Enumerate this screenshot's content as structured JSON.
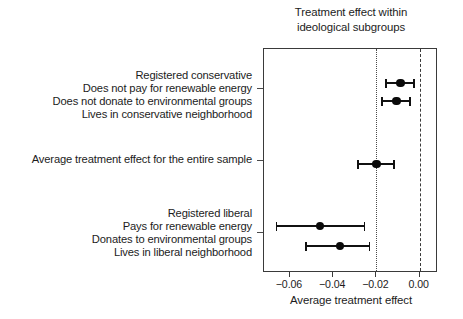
{
  "chart_data": {
    "type": "scatter",
    "title": "Treatment effect within ideological subgroups",
    "title_lines": [
      "Treatment effect within",
      "ideological subgroups"
    ],
    "xlabel": "Average treatment effect",
    "ylabel": "",
    "orientation": "horizontal",
    "grid": false,
    "legend": null,
    "xlim": [
      -0.072,
      0.0085
    ],
    "xticks": [
      -0.06,
      -0.04,
      -0.02,
      0.0
    ],
    "xticklabels": [
      "−0.06",
      "−0.04",
      "−0.02",
      "0.00"
    ],
    "reference_lines": [
      {
        "name": "average-effect-line",
        "value": -0.02,
        "style": "dotted"
      },
      {
        "name": "zero-line",
        "value": 0.0,
        "style": "dashed"
      }
    ],
    "categories": [
      "Registered conservative",
      "Does not pay for renewable energy",
      "Does not donate to environmental groups",
      "Lives in conservative neighborhood",
      "Average treatment effect for the entire sample",
      "Registered liberal",
      "Pays for renewable energy",
      "Donates to environmental groups",
      "Lives in liberal neighborhood"
    ],
    "points": [
      {
        "label": "Does not pay for renewable energy",
        "estimate": -0.0088,
        "ci_low": -0.0158,
        "ci_high": -0.0023
      },
      {
        "label": "Does not donate to environmental groups",
        "estimate": -0.0107,
        "ci_low": -0.0177,
        "ci_high": -0.0042
      },
      {
        "label": "Average treatment effect for the entire sample",
        "estimate": -0.02,
        "ci_low": -0.0288,
        "ci_high": -0.0116
      },
      {
        "label": "Pays for renewable energy",
        "estimate": -0.0461,
        "ci_low": -0.0665,
        "ci_high": -0.0251
      },
      {
        "label": "Donates to environmental groups",
        "estimate": -0.0368,
        "ci_low": -0.053,
        "ci_high": -0.0228
      }
    ]
  },
  "labels": {
    "group_conservative": [
      "Registered conservative",
      "Does not pay for renewable energy",
      "Does not donate to environmental groups",
      "Lives in conservative neighborhood"
    ],
    "group_average": [
      "Average treatment effect for the entire sample"
    ],
    "group_liberal": [
      "Registered liberal",
      "Pays for renewable energy",
      "Donates to environmental groups",
      "Lives in liberal neighborhood"
    ]
  },
  "colors": {
    "point": "#0a0a0a",
    "frame": "#3a3a3a",
    "text": "#1c1c1c",
    "background": "#ffffff"
  }
}
